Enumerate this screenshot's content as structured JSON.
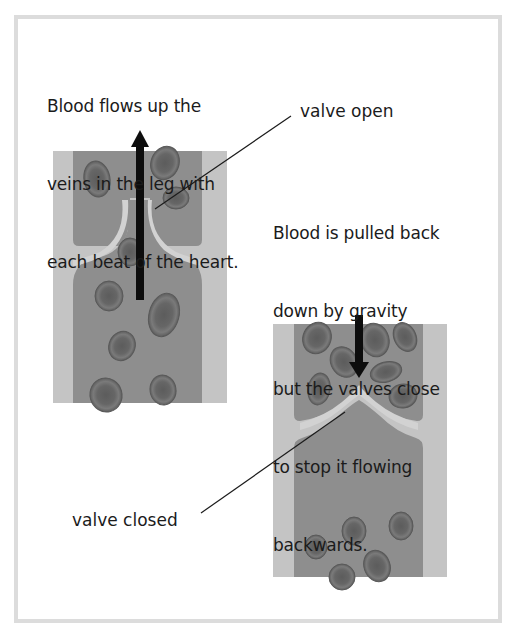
{
  "diagram": {
    "captions": {
      "upward_flow": [
        "Blood flows up the",
        "veins in the leg with",
        "each beat of the heart."
      ],
      "gravity": [
        "Blood is pulled back",
        "down by gravity",
        "but the valves close",
        "to stop it flowing",
        "backwards."
      ]
    },
    "labels": {
      "valve_open": "valve open",
      "valve_closed": "valve closed"
    },
    "veins": [
      {
        "id": "open-valve-vein",
        "state": "valve open",
        "flow_direction": "up"
      },
      {
        "id": "closed-valve-vein",
        "state": "valve closed",
        "flow_direction": "down"
      }
    ],
    "colors": {
      "vein_wall": "#c4c4c4",
      "vein_lumen": "#8e8e8e",
      "valve_flap": "#d2d2d2",
      "blood_cell": "#6e6e6e",
      "blood_cell_center": "#5a5a5a",
      "arrow": "#0d0d0d",
      "frame_border": "#dcdcdc"
    }
  }
}
